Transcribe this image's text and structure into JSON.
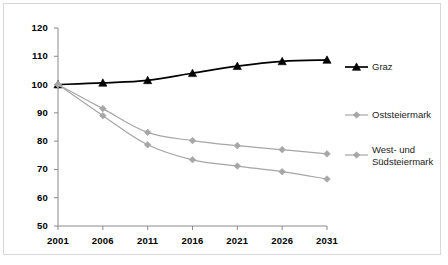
{
  "chart_data": {
    "type": "line",
    "title": "",
    "subtitle": "",
    "xlabel": "",
    "ylabel": "",
    "categories": [
      "2001",
      "2006",
      "2011",
      "2016",
      "2021",
      "2026",
      "2031"
    ],
    "x": [
      2001,
      2006,
      2011,
      2016,
      2021,
      2026,
      2031
    ],
    "xlim": [
      2001,
      2031
    ],
    "ylim": [
      50,
      120
    ],
    "yticks": [
      50,
      60,
      70,
      80,
      90,
      100,
      110,
      120
    ],
    "ytick_labels": [
      "50",
      "60",
      "70",
      "80",
      "90",
      "100",
      "110",
      "120"
    ],
    "grid": false,
    "legend_position": "right",
    "series": [
      {
        "name": "Graz",
        "values": [
          100,
          100.6,
          101.5,
          104.0,
          106.5,
          108.2,
          108.7
        ],
        "color": "#000000",
        "marker": "triangle",
        "marker_color": "#000000"
      },
      {
        "name": "Oststeiermark",
        "values": [
          100,
          91.5,
          83.1,
          80.2,
          78.4,
          77.0,
          75.5
        ],
        "color": "#a6a6a6",
        "marker": "diamond",
        "marker_color": "#a6a6a6"
      },
      {
        "name": "West- und Südsteiermark",
        "values": [
          100,
          89.0,
          78.7,
          73.4,
          71.2,
          69.2,
          66.6
        ],
        "color": "#a6a6a6",
        "marker": "diamond",
        "marker_color": "#a6a6a6"
      }
    ]
  },
  "legend": {
    "entries": [
      {
        "label": "Graz",
        "line2": ""
      },
      {
        "label": "Oststeiermark",
        "line2": ""
      },
      {
        "label": "West- und",
        "line2": "Südsteiermark"
      }
    ]
  },
  "colors": {
    "axis": "#808080",
    "frame": "#d8d8d8",
    "series_dark": "#000000",
    "series_gray": "#a6a6a6",
    "text": "#000000"
  }
}
